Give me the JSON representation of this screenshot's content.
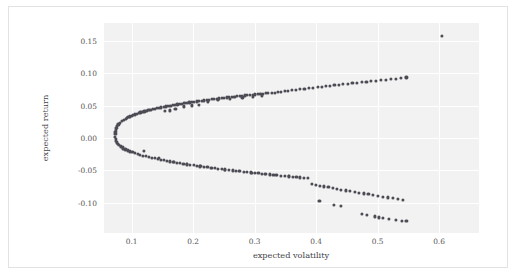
{
  "chart_data": {
    "type": "scatter",
    "title": "",
    "subtitle": "",
    "xlabel": "expected volatility",
    "ylabel": "expected return",
    "xlim": [
      0.055,
      0.665
    ],
    "ylim": [
      -0.147,
      0.178
    ],
    "xticks": [
      "0.1",
      "0.2",
      "0.3",
      "0.4",
      "0.5",
      "0.6"
    ],
    "xtick_values": [
      0.1,
      0.2,
      0.3,
      0.4,
      0.5,
      0.6
    ],
    "yticks": [
      "0.15",
      "0.10",
      "0.05",
      "0.00",
      "-0.05",
      "-0.10"
    ],
    "ytick_values": [
      0.15,
      0.1,
      0.05,
      0.0,
      -0.05,
      -0.1
    ],
    "grid": true,
    "grid_color": "#ffffff",
    "plot_bgcolor": "#f2f2f3",
    "figure_bgcolor": "#ffffff",
    "marker_color": "#4c4c54",
    "marker_size": 3.2,
    "legend": null,
    "series": [
      {
        "name": "random portfolios",
        "points": [
          [
            0.0735,
            0.0058
          ],
          [
            0.0733,
            0.0022
          ],
          [
            0.0736,
            0.0092
          ],
          [
            0.0738,
            -0.0012
          ],
          [
            0.0742,
            0.0125
          ],
          [
            0.0745,
            -0.0042
          ],
          [
            0.0751,
            0.0155
          ],
          [
            0.0756,
            -0.0068
          ],
          [
            0.0764,
            0.0185
          ],
          [
            0.0772,
            -0.0092
          ],
          [
            0.0783,
            0.0212
          ],
          [
            0.0795,
            -0.0112
          ],
          [
            0.0808,
            0.0238
          ],
          [
            0.0824,
            -0.0128
          ],
          [
            0.0841,
            0.0262
          ],
          [
            0.0859,
            -0.0141
          ],
          [
            0.0879,
            0.0285
          ],
          [
            0.0901,
            0.0298
          ],
          [
            0.0924,
            0.031
          ],
          [
            0.0948,
            0.0322
          ],
          [
            0.0973,
            0.0334
          ],
          [
            0.0999,
            0.0345
          ],
          [
            0.1026,
            0.0356
          ],
          [
            0.1054,
            0.0366
          ],
          [
            0.1083,
            0.0376
          ],
          [
            0.1113,
            0.0386
          ],
          [
            0.1143,
            0.0395
          ],
          [
            0.1175,
            0.0404
          ],
          [
            0.1207,
            0.0413
          ],
          [
            0.1239,
            0.0421
          ],
          [
            0.1272,
            0.043
          ],
          [
            0.1306,
            0.0438
          ],
          [
            0.134,
            0.0446
          ],
          [
            0.1375,
            0.0453
          ],
          [
            0.141,
            0.0461
          ],
          [
            0.1446,
            0.0468
          ],
          [
            0.1482,
            0.0475
          ],
          [
            0.1518,
            0.0482
          ],
          [
            0.1555,
            0.0489
          ],
          [
            0.1592,
            0.0496
          ],
          [
            0.1629,
            0.0502
          ],
          [
            0.1667,
            0.0509
          ],
          [
            0.1705,
            0.0515
          ],
          [
            0.1743,
            0.0521
          ],
          [
            0.1782,
            0.0527
          ],
          [
            0.182,
            0.0533
          ],
          [
            0.1859,
            0.0539
          ],
          [
            0.1898,
            0.0545
          ],
          [
            0.1938,
            0.0551
          ],
          [
            0.1977,
            0.0556
          ],
          [
            0.2017,
            0.0562
          ],
          [
            0.2057,
            0.0567
          ],
          [
            0.2097,
            0.0573
          ],
          [
            0.2137,
            0.0578
          ],
          [
            0.2177,
            0.0583
          ],
          [
            0.2218,
            0.0589
          ],
          [
            0.2258,
            0.0594
          ],
          [
            0.2299,
            0.0599
          ],
          [
            0.234,
            0.0604
          ],
          [
            0.2381,
            0.0609
          ],
          [
            0.2422,
            0.0614
          ],
          [
            0.2463,
            0.0618
          ],
          [
            0.2505,
            0.0623
          ],
          [
            0.2546,
            0.0628
          ],
          [
            0.2588,
            0.0633
          ],
          [
            0.2629,
            0.0637
          ],
          [
            0.2671,
            0.0642
          ],
          [
            0.2713,
            0.0646
          ],
          [
            0.2755,
            0.0651
          ],
          [
            0.2797,
            0.0655
          ],
          [
            0.2839,
            0.0659
          ],
          [
            0.2881,
            0.0664
          ],
          [
            0.2923,
            0.0668
          ],
          [
            0.2966,
            0.0672
          ],
          [
            0.3008,
            0.0676
          ],
          [
            0.3051,
            0.068
          ],
          [
            0.3093,
            0.0684
          ],
          [
            0.3136,
            0.0688
          ],
          [
            0.3179,
            0.0692
          ],
          [
            0.3221,
            0.0696
          ],
          [
            0.154,
            0.0425
          ],
          [
            0.1625,
            0.0428
          ],
          [
            0.1712,
            0.0455
          ],
          [
            0.1851,
            0.049
          ],
          [
            0.1975,
            0.0505
          ],
          [
            0.209,
            0.0518
          ],
          [
            0.224,
            0.0568
          ],
          [
            0.2405,
            0.0592
          ],
          [
            0.2602,
            0.0611
          ],
          [
            0.28,
            0.0628
          ],
          [
            0.2968,
            0.0639
          ],
          [
            0.3125,
            0.0652
          ],
          [
            0.328,
            0.07
          ],
          [
            0.3328,
            0.0703
          ],
          [
            0.3378,
            0.0712
          ],
          [
            0.343,
            0.0718
          ],
          [
            0.3488,
            0.0726
          ],
          [
            0.3548,
            0.0733
          ],
          [
            0.361,
            0.074
          ],
          [
            0.3672,
            0.0747
          ],
          [
            0.3741,
            0.0755
          ],
          [
            0.381,
            0.0762
          ],
          [
            0.3885,
            0.0771
          ],
          [
            0.395,
            0.0778
          ],
          [
            0.4025,
            0.0788
          ],
          [
            0.409,
            0.0794
          ],
          [
            0.4158,
            0.0801
          ],
          [
            0.4228,
            0.081
          ],
          [
            0.4298,
            0.0818
          ],
          [
            0.437,
            0.0826
          ],
          [
            0.4442,
            0.0834
          ],
          [
            0.4515,
            0.0841
          ],
          [
            0.459,
            0.0849
          ],
          [
            0.4665,
            0.0857
          ],
          [
            0.474,
            0.0865
          ],
          [
            0.4818,
            0.0873
          ],
          [
            0.4895,
            0.0881
          ],
          [
            0.4975,
            0.0889
          ],
          [
            0.5055,
            0.0897
          ],
          [
            0.5135,
            0.0904
          ],
          [
            0.5218,
            0.0913
          ],
          [
            0.53,
            0.0921
          ],
          [
            0.5385,
            0.0929
          ],
          [
            0.547,
            0.0937
          ],
          [
            0.6052,
            0.1578
          ],
          [
            0.083,
            -0.0142
          ],
          [
            0.0862,
            -0.016
          ],
          [
            0.0897,
            -0.0176
          ],
          [
            0.0934,
            -0.0192
          ],
          [
            0.0972,
            -0.0207
          ],
          [
            0.1012,
            -0.0221
          ],
          [
            0.1053,
            -0.0234
          ],
          [
            0.1096,
            -0.0247
          ],
          [
            0.1139,
            -0.0259
          ],
          [
            0.1184,
            -0.0271
          ],
          [
            0.123,
            -0.0282
          ],
          [
            0.1277,
            -0.0293
          ],
          [
            0.1324,
            -0.0304
          ],
          [
            0.1373,
            -0.0314
          ],
          [
            0.1422,
            -0.0324
          ],
          [
            0.1472,
            -0.0334
          ],
          [
            0.1523,
            -0.0343
          ],
          [
            0.1575,
            -0.0353
          ],
          [
            0.1627,
            -0.0362
          ],
          [
            0.168,
            -0.0371
          ],
          [
            0.1733,
            -0.0379
          ],
          [
            0.1787,
            -0.0388
          ],
          [
            0.1841,
            -0.0396
          ],
          [
            0.1896,
            -0.0404
          ],
          [
            0.1951,
            -0.0412
          ],
          [
            0.2007,
            -0.042
          ],
          [
            0.2063,
            -0.0428
          ],
          [
            0.2119,
            -0.0436
          ],
          [
            0.2176,
            -0.0443
          ],
          [
            0.2233,
            -0.0451
          ],
          [
            0.229,
            -0.0458
          ],
          [
            0.2348,
            -0.0465
          ],
          [
            0.2406,
            -0.0472
          ],
          [
            0.2464,
            -0.0479
          ],
          [
            0.2523,
            -0.0486
          ],
          [
            0.2582,
            -0.0493
          ],
          [
            0.2641,
            -0.05
          ],
          [
            0.27,
            -0.0506
          ],
          [
            0.276,
            -0.0513
          ],
          [
            0.282,
            -0.0519
          ],
          [
            0.288,
            -0.0526
          ],
          [
            0.294,
            -0.0532
          ],
          [
            0.3001,
            -0.0538
          ],
          [
            0.3062,
            -0.0545
          ],
          [
            0.3123,
            -0.0551
          ],
          [
            0.3184,
            -0.0557
          ],
          [
            0.3245,
            -0.0563
          ],
          [
            0.3307,
            -0.0569
          ],
          [
            0.3368,
            -0.0575
          ],
          [
            0.343,
            -0.0581
          ],
          [
            0.3492,
            -0.0587
          ],
          [
            0.3555,
            -0.0592
          ],
          [
            0.3617,
            -0.0598
          ],
          [
            0.368,
            -0.0604
          ],
          [
            0.3743,
            -0.0609
          ],
          [
            0.3806,
            -0.0615
          ],
          [
            0.3869,
            -0.062
          ],
          [
            0.1195,
            -0.0198
          ],
          [
            0.144,
            -0.0312
          ],
          [
            0.169,
            -0.0375
          ],
          [
            0.1905,
            -0.0408
          ],
          [
            0.2108,
            -0.0438
          ],
          [
            0.23,
            -0.0462
          ],
          [
            0.2512,
            -0.0488
          ],
          [
            0.2742,
            -0.0512
          ],
          [
            0.296,
            -0.0535
          ],
          [
            0.3165,
            -0.0558
          ],
          [
            0.335,
            -0.0573
          ],
          [
            0.356,
            -0.0595
          ],
          [
            0.393,
            -0.071
          ],
          [
            0.3995,
            -0.0722
          ],
          [
            0.406,
            -0.0735
          ],
          [
            0.413,
            -0.0748
          ],
          [
            0.42,
            -0.076
          ],
          [
            0.427,
            -0.0773
          ],
          [
            0.434,
            -0.0785
          ],
          [
            0.441,
            -0.0797
          ],
          [
            0.4482,
            -0.081
          ],
          [
            0.4555,
            -0.0822
          ],
          [
            0.4628,
            -0.0834
          ],
          [
            0.4702,
            -0.0846
          ],
          [
            0.4778,
            -0.0858
          ],
          [
            0.4852,
            -0.087
          ],
          [
            0.493,
            -0.0882
          ],
          [
            0.5008,
            -0.0894
          ],
          [
            0.5086,
            -0.0906
          ],
          [
            0.5166,
            -0.0918
          ],
          [
            0.5246,
            -0.093
          ],
          [
            0.5328,
            -0.0942
          ],
          [
            0.541,
            -0.0954
          ],
          [
            0.4055,
            -0.0975
          ],
          [
            0.429,
            -0.1032
          ],
          [
            0.4405,
            -0.1055
          ],
          [
            0.475,
            -0.1175
          ],
          [
            0.483,
            -0.1188
          ],
          [
            0.496,
            -0.1212
          ],
          [
            0.5018,
            -0.123
          ],
          [
            0.5085,
            -0.124
          ],
          [
            0.518,
            -0.1252
          ],
          [
            0.5298,
            -0.1265
          ],
          [
            0.54,
            -0.1278
          ],
          [
            0.5468,
            -0.1288
          ]
        ]
      }
    ]
  }
}
